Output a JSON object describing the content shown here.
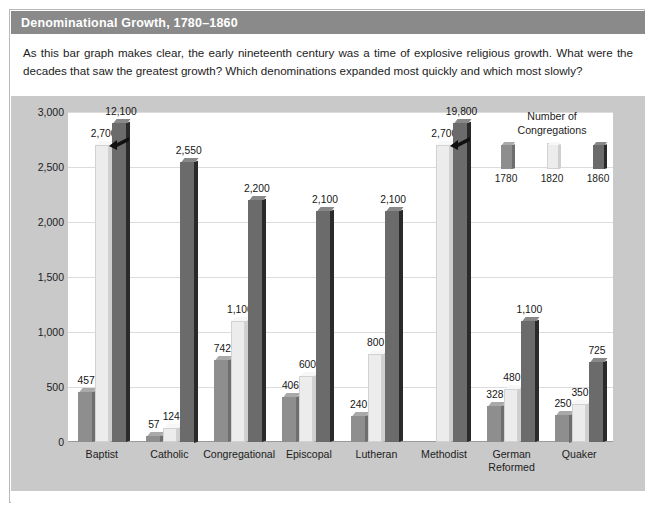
{
  "figure": {
    "title": "Denominational Growth, 1780–1860",
    "caption": "As this bar graph makes clear, the early nineteenth century was a time of explosive religious growth. What were the decades that saw the greatest growth? Which denominations expanded most quickly and which most slowly?"
  },
  "legend": {
    "title_line1": "Number of",
    "title_line2": "Congregations",
    "items": [
      {
        "label": "1780",
        "color": "#8e8e8e"
      },
      {
        "label": "1820",
        "color": "#ececec"
      },
      {
        "label": "1860",
        "color": "#6b6b6b"
      }
    ]
  },
  "colors": {
    "header_bar": "#8a8a8a",
    "panel_background": "#c9c9c9",
    "plot_background": "#ffffff",
    "gridline": "#dcdcdc",
    "series_1780": "#8e8e8e",
    "series_1820": "#ececec",
    "series_1860": "#6b6b6b"
  },
  "chart_data": {
    "type": "bar",
    "title": "Denominational Growth, 1780–1860",
    "xlabel": "",
    "ylabel": "Number of Congregations",
    "ylim": [
      0,
      3000
    ],
    "ytick_labels": [
      "3,000",
      "2,500",
      "2,000",
      "1,500",
      "1,000",
      "500",
      "0"
    ],
    "ytick_values": [
      3000,
      2500,
      2000,
      1500,
      1000,
      500,
      0
    ],
    "grid": true,
    "legend_position": "top-right",
    "axis_break_note": "Baptist 1860 (12,100) and Methodist 1860 (19,800) bars are truncated with a break mark; drawn to approximately 2,900 on the axis.",
    "categories": [
      "Baptist",
      "Catholic",
      "Congregational",
      "Episcopal",
      "Lutheran",
      "Methodist",
      "German Reformed",
      "Quaker"
    ],
    "series": [
      {
        "name": "1780",
        "values": [
          457,
          57,
          742,
          406,
          240,
          null,
          328,
          250
        ]
      },
      {
        "name": "1820",
        "values": [
          2700,
          124,
          1100,
          600,
          800,
          2700,
          480,
          350
        ]
      },
      {
        "name": "1860",
        "values": [
          12100,
          2550,
          2200,
          2100,
          2100,
          19800,
          1100,
          725
        ]
      }
    ],
    "data_labels": [
      {
        "category": "Baptist",
        "labels": [
          "457",
          "2,700",
          "12,100"
        ]
      },
      {
        "category": "Catholic",
        "labels": [
          "57",
          "124",
          "2,550"
        ]
      },
      {
        "category": "Congregational",
        "labels": [
          "742",
          "1,100",
          "2,200"
        ]
      },
      {
        "category": "Episcopal",
        "labels": [
          "406",
          "600",
          "2,100"
        ]
      },
      {
        "category": "Lutheran",
        "labels": [
          "240",
          "800",
          "2,100"
        ]
      },
      {
        "category": "Methodist",
        "labels": [
          "",
          "2,700",
          "19,800"
        ]
      },
      {
        "category": "German Reformed",
        "labels": [
          "328",
          "480",
          "1,100"
        ]
      },
      {
        "category": "Quaker",
        "labels": [
          "250",
          "350",
          "725"
        ]
      }
    ]
  }
}
